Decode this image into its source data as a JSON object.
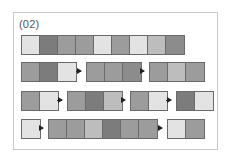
{
  "label": "(02)",
  "palette": {
    "light": "#e3e3e3",
    "midlight": "#bdbdbd",
    "mid": "#9c9c9c",
    "middark": "#8c8c8c",
    "dark": "#7c7c7c"
  },
  "rows": [
    {
      "top": 35,
      "groups": [
        {
          "left": 21,
          "cells": [
            "light",
            "dark",
            "mid",
            "mid",
            "light",
            "mid",
            "light",
            "midlight",
            "middark"
          ]
        }
      ],
      "arrows": []
    },
    {
      "top": 62,
      "groups": [
        {
          "left": 21,
          "cells": [
            "mid",
            "dark",
            "light"
          ]
        },
        {
          "left": 86,
          "cells": [
            "mid",
            "mid",
            "middark"
          ]
        },
        {
          "left": 149,
          "cells": [
            "mid",
            "midlight",
            "mid"
          ]
        }
      ],
      "arrows": [
        {
          "left": 76,
          "width": 9
        },
        {
          "left": 140,
          "width": 8
        }
      ]
    },
    {
      "top": 91,
      "groups": [
        {
          "left": 21,
          "cells": [
            "mid",
            "light"
          ]
        },
        {
          "left": 67,
          "cells": [
            "mid",
            "dark",
            "midlight"
          ]
        },
        {
          "left": 130,
          "cells": [
            "mid",
            "light"
          ]
        },
        {
          "left": 176,
          "cells": [
            "dark",
            "light"
          ]
        }
      ],
      "arrows": [
        {
          "left": 57,
          "width": 9
        },
        {
          "left": 121,
          "width": 8
        },
        {
          "left": 166,
          "width": 9
        }
      ]
    },
    {
      "top": 119,
      "groups": [
        {
          "left": 21,
          "cells": [
            "light"
          ]
        },
        {
          "left": 48,
          "cells": [
            "mid",
            "mid",
            "midlight",
            "dark",
            "mid",
            "mid"
          ]
        },
        {
          "left": 167,
          "cells": [
            "light",
            "mid"
          ]
        }
      ],
      "arrows": [
        {
          "left": 39,
          "width": 8
        },
        {
          "left": 158,
          "width": 8
        }
      ]
    }
  ]
}
